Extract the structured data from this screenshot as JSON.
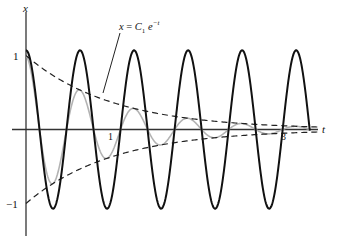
{
  "chart_data": {
    "type": "line",
    "title": "",
    "xlabel": "t",
    "ylabel": "x",
    "xlim": [
      0,
      3.4
    ],
    "ylim": [
      -1.4,
      1.6
    ],
    "x_ticks": [
      {
        "value": 1,
        "label": "1"
      },
      {
        "value": 3,
        "label": "3"
      }
    ],
    "y_ticks": [
      {
        "value": 1,
        "label": "1"
      },
      {
        "value": -1,
        "label": "-1"
      }
    ],
    "grid": false,
    "legend": null,
    "annotation": {
      "text": "x = C₁ e⁻ᵗ",
      "points_to": "upper envelope"
    },
    "series": [
      {
        "name": "undamped oscillation",
        "style": "solid black thick",
        "formula": "1.07 cos(10t)",
        "amplitude": 1.07,
        "omega": 10
      },
      {
        "name": "damped oscillation",
        "style": "solid gray",
        "formula": "e^{-t} cos(10t)",
        "amplitude": 1.0,
        "omega": 10,
        "decay": 1
      },
      {
        "name": "upper envelope",
        "style": "dashed black",
        "formula": "e^{-t}"
      },
      {
        "name": "lower envelope",
        "style": "dashed black",
        "formula": "-e^{-t}"
      }
    ],
    "sample_points": {
      "t": [
        0,
        0.5,
        1,
        1.5,
        2,
        2.5,
        3
      ],
      "envelope": [
        1.0,
        0.61,
        0.37,
        0.22,
        0.14,
        0.08,
        0.05
      ]
    }
  },
  "axes": {
    "x_label": "t",
    "y_label": "x",
    "tick_1": "1",
    "tick_3": "3",
    "y_tick_pos": "1",
    "y_tick_neg": "−1"
  },
  "annotation": {
    "lhs": "x",
    "eq": " = ",
    "c": "C",
    "sub": "1",
    "e": " e",
    "exp": "−t"
  },
  "colors": {
    "axis": "#333333",
    "black_curve": "#111111",
    "gray_curve": "#b3b3b3",
    "envelope": "#222222"
  }
}
